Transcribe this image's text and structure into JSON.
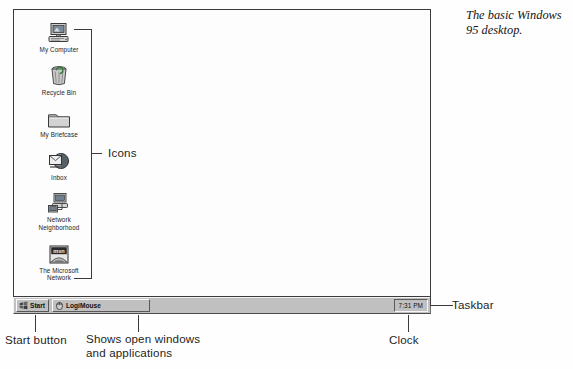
{
  "figure": {
    "caption": "The basic Windows 95 desktop."
  },
  "desktop": {
    "icons": [
      {
        "id": "my-computer",
        "label": "My Computer",
        "icon": "computer-icon"
      },
      {
        "id": "recycle-bin",
        "label": "Recycle Bin",
        "icon": "recycle-bin-icon"
      },
      {
        "id": "my-briefcase",
        "label": "My Briefcase",
        "icon": "briefcase-folder-icon"
      },
      {
        "id": "inbox",
        "label": "Inbox",
        "icon": "inbox-mail-icon"
      },
      {
        "id": "network-neighborhood",
        "label": "Network\nNeighborhood",
        "icon": "network-neighborhood-icon"
      },
      {
        "id": "microsoft-network",
        "label": "The Microsoft\nNetwork",
        "icon": "msn-icon"
      }
    ]
  },
  "taskbar": {
    "start_button": {
      "label": "Start",
      "icon": "windows-flag-icon"
    },
    "tasks": [
      {
        "label": "LogiMouse",
        "icon": "logimouse-icon"
      }
    ],
    "tray": {
      "clock": "7:31 PM"
    }
  },
  "annotations": {
    "icons": "Icons",
    "start_button": "Start button",
    "task_area": "Shows open windows\nand applications",
    "taskbar": "Taskbar",
    "clock": "Clock"
  },
  "colors": {
    "ink": "#3b3b3b",
    "taskbar_face": "#c0c0c0",
    "taskbar_shadow": "#575757",
    "taskbar_highlight": "#fbfbfb",
    "page_background": "#fefefe"
  }
}
